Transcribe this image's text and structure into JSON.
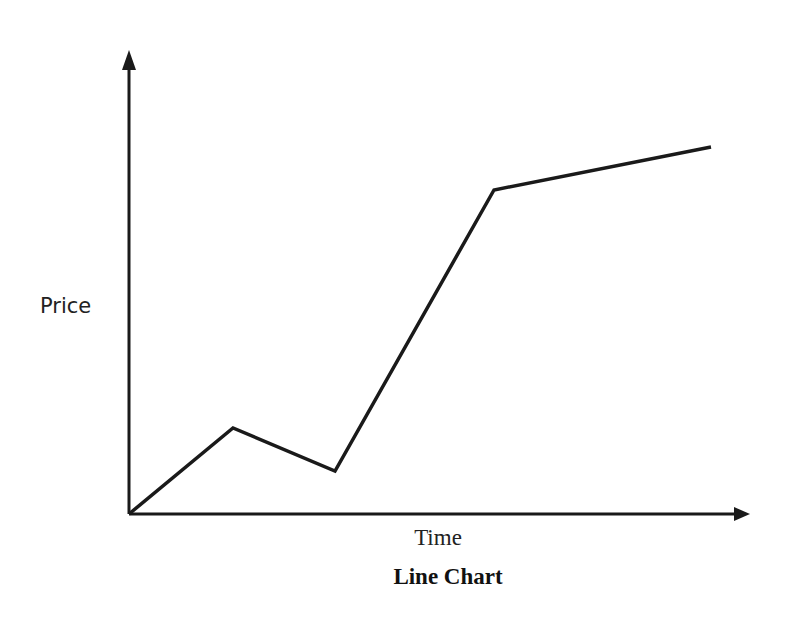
{
  "chart_data": {
    "type": "line",
    "title": "Line Chart",
    "xlabel": "Time",
    "ylabel": "Price",
    "grid": false,
    "legend": null,
    "x_ticks": [],
    "y_ticks": [],
    "x": [
      0,
      1,
      2,
      3,
      4
    ],
    "series": [
      {
        "name": "Price",
        "values": [
          0,
          19,
          9.5,
          71,
          80.5
        ]
      }
    ],
    "ylim": [
      0,
      100
    ],
    "xlim": [
      0,
      6
    ]
  },
  "colors": {
    "line": "#1a1a1a",
    "axes": "#1a1a1a",
    "background": "#ffffff"
  },
  "geometry": {
    "origin": [
      129,
      514
    ],
    "y_axis_top": 55,
    "x_axis_right": 748,
    "points_px": [
      [
        129,
        514
      ],
      [
        233,
        428
      ],
      [
        335,
        471
      ],
      [
        494,
        190
      ],
      [
        711,
        147
      ]
    ]
  }
}
